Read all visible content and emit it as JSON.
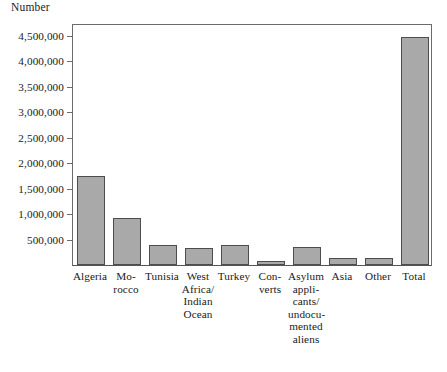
{
  "chart_data": {
    "type": "bar",
    "title": "",
    "ylabel": "Number",
    "xlabel": "",
    "ylim": [
      0,
      4750000
    ],
    "grid": false,
    "legend": null,
    "ytick_labels": [
      "500,000",
      "1,000,000",
      "1,500,000",
      "2,000,000",
      "2,500,000",
      "3,000,000",
      "3,500,000",
      "4,000,000",
      "4,500,000"
    ],
    "ytick_values": [
      500000,
      1000000,
      1500000,
      2000000,
      2500000,
      3000000,
      3500000,
      4000000,
      4500000
    ],
    "categories": [
      "Algeria",
      "Mo-\nrocco",
      "Tunisia",
      "West\nAfrica/\nIndian\nOcean",
      "Turkey",
      "Con-\nverts",
      "Asylum\nappli-\ncants/\nundocu-\nmented\naliens",
      "Asia",
      "Other",
      "Total"
    ],
    "category_lines": [
      [
        "Algeria"
      ],
      [
        "Mo-",
        "rocco"
      ],
      [
        "Tunisia"
      ],
      [
        "West",
        "Africa/",
        "Indian",
        "Ocean"
      ],
      [
        "Turkey"
      ],
      [
        "Con-",
        "verts"
      ],
      [
        "Asylum",
        "appli-",
        "cants/",
        "undocu-",
        "mented",
        "aliens"
      ],
      [
        "Asia"
      ],
      [
        "Other"
      ],
      [
        "Total"
      ]
    ],
    "values": [
      1750000,
      930000,
      400000,
      330000,
      400000,
      80000,
      360000,
      130000,
      130000,
      4480000
    ],
    "bar_color": "#a9a9a9",
    "bar_edge_color": "#4d4d4d",
    "axis_color": "#6b6b6b"
  }
}
